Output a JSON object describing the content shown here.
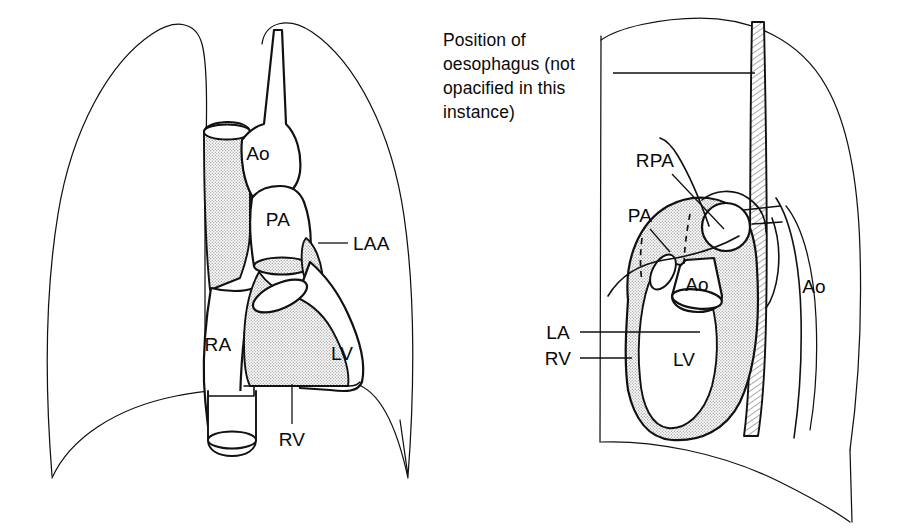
{
  "figure": {
    "background_color": "#ffffff",
    "ink_color": "#111111",
    "stipple_color": "#c9c9c9"
  },
  "panels": [
    {
      "id": "frontal",
      "name": "Frontal (PA) projection",
      "labels": [
        {
          "key": "ao",
          "text": "Ao",
          "x": 258,
          "y": 160
        },
        {
          "key": "pa",
          "text": "PA",
          "x": 274,
          "y": 218
        },
        {
          "key": "laa",
          "text": "LAA",
          "x": 330,
          "y": 248
        },
        {
          "key": "ra",
          "text": "RA",
          "x": 196,
          "y": 344
        },
        {
          "key": "lv",
          "text": "LV",
          "x": 340,
          "y": 360
        },
        {
          "key": "rv",
          "text": "RV",
          "x": 286,
          "y": 438
        }
      ]
    },
    {
      "id": "lateral",
      "name": "Lateral projection",
      "labels": [
        {
          "key": "rpa",
          "text": "RPA",
          "x": 652,
          "y": 160
        },
        {
          "key": "pa",
          "text": "PA",
          "x": 637,
          "y": 215
        },
        {
          "key": "ao_mid",
          "text": "Ao",
          "x": 690,
          "y": 292
        },
        {
          "key": "ao_desc",
          "text": "Ao",
          "x": 811,
          "y": 293
        },
        {
          "key": "la",
          "text": "LA",
          "x": 560,
          "y": 339
        },
        {
          "key": "rv",
          "text": "RV",
          "x": 560,
          "y": 365
        },
        {
          "key": "lv",
          "text": "LV",
          "x": 682,
          "y": 366
        }
      ],
      "caption": {
        "key": "oesophagus-note",
        "lines": [
          "Position of",
          "oesophagus (not",
          "opacified in this",
          "instance)"
        ],
        "x": 443,
        "y": 46,
        "line_height": 24
      }
    }
  ],
  "structures": {
    "Ao": "Aorta",
    "PA": "Pulmonary artery",
    "RPA": "Right pulmonary artery",
    "LAA": "Left atrial appendage",
    "RA": "Right atrium",
    "LA": "Left atrium",
    "RV": "Right ventricle",
    "LV": "Left ventricle"
  }
}
